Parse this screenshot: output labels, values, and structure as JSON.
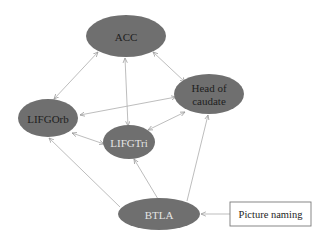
{
  "diagram": {
    "type": "directed-graph",
    "node_fill": "#6f6f6f",
    "edge_color": "#b5b5b5",
    "nodes": [
      {
        "id": "acc",
        "label": "ACC"
      },
      {
        "id": "head_of_caudate",
        "label_line1": "Head of",
        "label_line2": "caudate"
      },
      {
        "id": "lifgorb",
        "label": "LIFGOrb"
      },
      {
        "id": "lifgtri",
        "label": "LIFGTri"
      },
      {
        "id": "btla",
        "label": "BTLA"
      },
      {
        "id": "picture_naming",
        "label": "Picture naming"
      }
    ],
    "edges": [
      {
        "from": "ACC",
        "to": "LIFGOrb",
        "bidirectional": true
      },
      {
        "from": "ACC",
        "to": "LIFGTri",
        "bidirectional": true
      },
      {
        "from": "ACC",
        "to": "Head of caudate",
        "bidirectional": true
      },
      {
        "from": "LIFGOrb",
        "to": "Head of caudate",
        "bidirectional": true
      },
      {
        "from": "LIFGOrb",
        "to": "LIFGTri",
        "bidirectional": true
      },
      {
        "from": "Head of caudate",
        "to": "LIFGTri",
        "bidirectional": true
      },
      {
        "from": "BTLA",
        "to": "LIFGOrb",
        "bidirectional": false
      },
      {
        "from": "BTLA",
        "to": "LIFGTri",
        "bidirectional": false
      },
      {
        "from": "BTLA",
        "to": "Head of caudate",
        "bidirectional": false
      },
      {
        "from": "Picture naming",
        "to": "BTLA",
        "bidirectional": false
      }
    ]
  }
}
